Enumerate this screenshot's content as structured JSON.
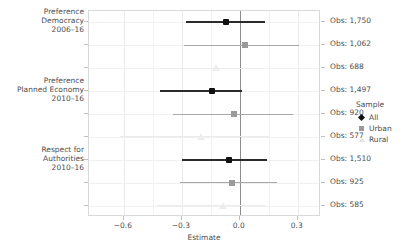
{
  "chart_data": {
    "type": "scatter",
    "title": "",
    "xlabel": "Estimate",
    "ylabel": "",
    "xlim": [
      -0.78,
      0.42
    ],
    "xticks": [
      -0.6,
      -0.3,
      0.0,
      0.3
    ],
    "xticklabels": [
      "−0.6",
      "−0.3",
      "0.0",
      "0.3"
    ],
    "grid": true,
    "legend": {
      "title": "Sample",
      "position": "right",
      "entries": [
        {
          "label": "All",
          "marker": "diamond",
          "color": "#111111"
        },
        {
          "label": "Urban",
          "marker": "square",
          "color": "#9a9a9a"
        },
        {
          "label": "Rural",
          "marker": "triangle",
          "color": "#e3e3e3"
        }
      ]
    },
    "groups": [
      {
        "label": "Preference\nDemocracy\n2006–16",
        "label_lines": [
          "Preference",
          "Democracy",
          "2006–16"
        ]
      },
      {
        "label": "Preference\nPlanned Economy\n2010–16",
        "label_lines": [
          "Preference",
          "Planned Economy",
          "2010–16"
        ]
      },
      {
        "label": "Respect for\nAuthorities\n2010–16",
        "label_lines": [
          "Respect for",
          "Authorities",
          "2010–16"
        ]
      }
    ],
    "points": [
      {
        "group": "Preference Democracy 2006-16",
        "sample": "All",
        "estimate": -0.07,
        "ci_low": -0.277,
        "ci_high": 0.131,
        "obs_label": "Obs: 1,750",
        "obs": 1750
      },
      {
        "group": "Preference Democracy 2006-16",
        "sample": "Urban",
        "estimate": 0.027,
        "ci_low": -0.287,
        "ci_high": 0.308,
        "obs_label": "Obs: 1,062",
        "obs": 1062
      },
      {
        "group": "Preference Democracy 2006-16",
        "sample": "Rural",
        "estimate": -0.125,
        "ci_low": -0.43,
        "ci_high": 0.12,
        "obs_label": "Obs: 688",
        "obs": 688
      },
      {
        "group": "Preference Planned Economy 2010-16",
        "sample": "All",
        "estimate": -0.145,
        "ci_low": -0.415,
        "ci_high": 0.01,
        "obs_label": "Obs: 1,497",
        "obs": 1497
      },
      {
        "group": "Preference Planned Economy 2010-16",
        "sample": "Urban",
        "estimate": -0.03,
        "ci_low": -0.345,
        "ci_high": 0.275,
        "obs_label": "Obs: 920",
        "obs": 920
      },
      {
        "group": "Preference Planned Economy 2010-16",
        "sample": "Rural",
        "estimate": -0.2,
        "ci_low": -0.62,
        "ci_high": 0.15,
        "obs_label": "Obs: 577",
        "obs": 577
      },
      {
        "group": "Respect for Authorities 2010-16",
        "sample": "All",
        "estimate": -0.055,
        "ci_low": -0.3,
        "ci_high": 0.142,
        "obs_label": "Obs: 1,510",
        "obs": 1510
      },
      {
        "group": "Respect for Authorities 2010-16",
        "sample": "Urban",
        "estimate": -0.04,
        "ci_low": -0.31,
        "ci_high": 0.195,
        "obs_label": "Obs: 925",
        "obs": 925
      },
      {
        "group": "Respect for Authorities 2010-16",
        "sample": "Rural",
        "estimate": -0.085,
        "ci_low": -0.43,
        "ci_high": 0.13,
        "obs_label": "Obs: 585",
        "obs": 585
      }
    ]
  }
}
